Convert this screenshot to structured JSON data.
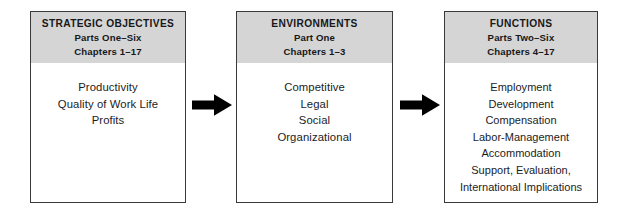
{
  "diagram": {
    "background_color": "#ffffff",
    "header_band_color": "#d5d5d5",
    "border_color": "#3a3a3a",
    "text_color": "#17181a",
    "arrow_color": "#000000",
    "boxes": [
      {
        "id": "strategic-objectives",
        "header": {
          "title": "STRATEGIC OBJECTIVES",
          "parts": "Parts One–Six",
          "chapters": "Chapters 1–17"
        },
        "items": [
          "Productivity",
          "Quality of Work Life",
          "Profits"
        ]
      },
      {
        "id": "environments",
        "header": {
          "title": "ENVIRONMENTS",
          "parts": "Part One",
          "chapters": "Chapters 1–3"
        },
        "items": [
          "Competitive",
          "Legal",
          "Social",
          "Organizational"
        ]
      },
      {
        "id": "functions",
        "header": {
          "title": "FUNCTIONS",
          "parts": "Parts Two–Six",
          "chapters": "Chapters 4–17"
        },
        "items": [
          "Employment",
          "Development",
          "Compensation",
          "Labor-Management",
          "Accommodation",
          "Support, Evaluation,",
          "International Implications"
        ]
      }
    ],
    "arrows": [
      {
        "id": "arrow-objectives-to-environments",
        "direction": "right"
      },
      {
        "id": "arrow-environments-to-functions",
        "direction": "right"
      }
    ]
  }
}
